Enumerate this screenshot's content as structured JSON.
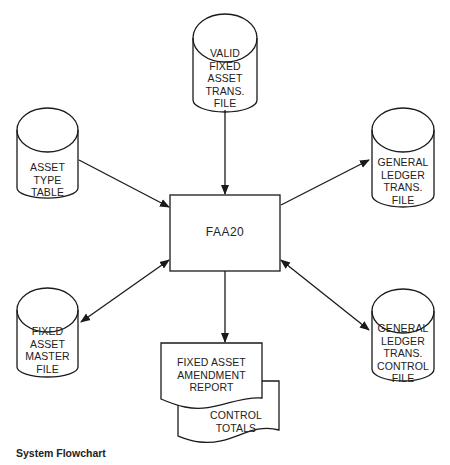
{
  "diagram": {
    "type": "system-flowchart",
    "caption": "System Flowchart",
    "process": {
      "id": "faa20",
      "label": "FAA20"
    },
    "files": [
      {
        "id": "valid-fixed-asset-trans-file",
        "lines": [
          "VALID",
          "FIXED",
          "ASSET",
          "TRANS.",
          "FILE"
        ]
      },
      {
        "id": "asset-type-table",
        "lines": [
          "ASSET",
          "TYPE",
          "TABLE"
        ]
      },
      {
        "id": "general-ledger-trans-file",
        "lines": [
          "GENERAL",
          "LEDGER",
          "TRANS.",
          "FILE"
        ]
      },
      {
        "id": "fixed-asset-master-file",
        "lines": [
          "FIXED",
          "ASSET",
          "MASTER",
          "FILE"
        ]
      },
      {
        "id": "general-ledger-trans-control-file",
        "lines": [
          "GENERAL",
          "LEDGER",
          "TRANS.",
          "CONTROL",
          "FILE"
        ]
      }
    ],
    "documents": [
      {
        "id": "fixed-asset-amendment-report",
        "lines": [
          "FIXED ASSET",
          "AMENDMENT",
          "REPORT"
        ]
      },
      {
        "id": "control-totals",
        "lines": [
          "CONTROL",
          "TOTALS"
        ]
      }
    ],
    "edges": [
      {
        "from": "valid-fixed-asset-trans-file",
        "to": "faa20",
        "direction": "one-way"
      },
      {
        "from": "asset-type-table",
        "to": "faa20",
        "direction": "one-way"
      },
      {
        "from": "faa20",
        "to": "general-ledger-trans-file",
        "direction": "one-way"
      },
      {
        "from": "faa20",
        "to": "fixed-asset-master-file",
        "direction": "two-way"
      },
      {
        "from": "faa20",
        "to": "general-ledger-trans-control-file",
        "direction": "two-way"
      },
      {
        "from": "faa20",
        "to": "fixed-asset-amendment-report",
        "direction": "one-way"
      }
    ]
  }
}
